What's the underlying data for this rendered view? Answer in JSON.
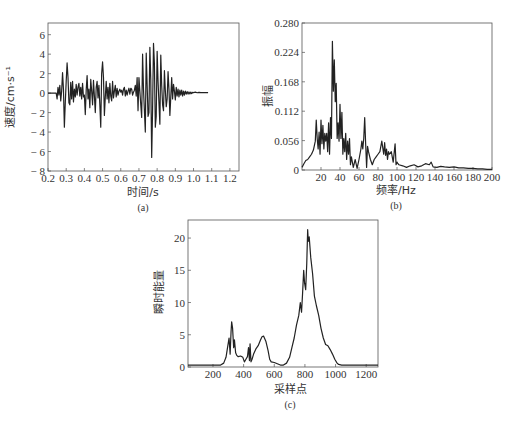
{
  "chart_data": [
    {
      "id": "a",
      "type": "line",
      "caption": "(a)",
      "xlabel": "时间/s",
      "ylabel": "速度/cm·s⁻¹",
      "xlim": [
        0.2,
        1.25
      ],
      "ylim": [
        -8,
        7.2
      ],
      "xticks": [
        0.2,
        0.3,
        0.4,
        0.5,
        0.6,
        0.7,
        0.8,
        0.9,
        1.0,
        1.1,
        1.2
      ],
      "xtick_labels": [
        "0.2",
        "0.3",
        "0.4",
        "0.5",
        "0.6",
        "0.7",
        "0.8",
        "0.9",
        "1.0",
        "1.1",
        "1.2"
      ],
      "yticks": [
        6,
        4,
        2,
        0,
        -2,
        -4,
        -6,
        -8
      ],
      "ytick_labels": [
        "6",
        "4",
        "2",
        "0",
        "− 2",
        "− 4",
        "− 6",
        "− 8"
      ],
      "grid": false,
      "series": [
        {
          "name": "velocity",
          "x": [
            0.2,
            0.245,
            0.25,
            0.255,
            0.26,
            0.265,
            0.27,
            0.275,
            0.28,
            0.285,
            0.29,
            0.295,
            0.3,
            0.305,
            0.31,
            0.315,
            0.32,
            0.325,
            0.33,
            0.335,
            0.34,
            0.345,
            0.35,
            0.355,
            0.36,
            0.365,
            0.37,
            0.375,
            0.38,
            0.385,
            0.39,
            0.395,
            0.4,
            0.405,
            0.41,
            0.415,
            0.42,
            0.425,
            0.43,
            0.435,
            0.44,
            0.445,
            0.45,
            0.455,
            0.46,
            0.465,
            0.47,
            0.475,
            0.48,
            0.485,
            0.49,
            0.495,
            0.5,
            0.505,
            0.51,
            0.515,
            0.52,
            0.525,
            0.53,
            0.535,
            0.54,
            0.545,
            0.55,
            0.555,
            0.56,
            0.565,
            0.57,
            0.575,
            0.58,
            0.585,
            0.59,
            0.595,
            0.6,
            0.605,
            0.61,
            0.615,
            0.62,
            0.625,
            0.63,
            0.635,
            0.64,
            0.645,
            0.65,
            0.655,
            0.66,
            0.665,
            0.67,
            0.675,
            0.68,
            0.685,
            0.69,
            0.695,
            0.7,
            0.705,
            0.71,
            0.715,
            0.72,
            0.725,
            0.73,
            0.735,
            0.74,
            0.745,
            0.75,
            0.755,
            0.76,
            0.765,
            0.77,
            0.775,
            0.78,
            0.785,
            0.79,
            0.795,
            0.8,
            0.805,
            0.81,
            0.815,
            0.82,
            0.825,
            0.83,
            0.835,
            0.84,
            0.845,
            0.85,
            0.855,
            0.86,
            0.865,
            0.87,
            0.875,
            0.88,
            0.885,
            0.89,
            0.895,
            0.9,
            0.905,
            0.91,
            0.915,
            0.92,
            0.925,
            0.93,
            0.935,
            0.94,
            0.945,
            0.95,
            0.955,
            0.96,
            0.965,
            0.97,
            0.975,
            0.98,
            0.985,
            0.99,
            0.995,
            1.0,
            1.01,
            1.02,
            1.03,
            1.04,
            1.05,
            1.06,
            1.07,
            1.08,
            1.09,
            1.1,
            1.12,
            1.14,
            1.16,
            1.18,
            1.2,
            1.25
          ],
          "values": [
            0,
            0,
            -0.6,
            0.6,
            -0.2,
            0.8,
            -0.8,
            0.2,
            2.1,
            0.4,
            -3.5,
            -1.0,
            1.2,
            3.1,
            1.6,
            -1.0,
            -1.2,
            1.1,
            -0.6,
            1.2,
            -0.9,
            0.4,
            -0.4,
            0.9,
            -0.2,
            0.6,
            1.0,
            -0.3,
            0.6,
            -0.6,
            1.0,
            -0.4,
            -0.2,
            -2.2,
            0.3,
            1.8,
            -0.6,
            0.4,
            -1.5,
            1.4,
            0.2,
            -1.2,
            1.3,
            -0.3,
            -2.0,
            0.6,
            1.2,
            -0.5,
            0.8,
            -1.2,
            -3.5,
            2.0,
            3.2,
            1.6,
            -2.3,
            -0.4,
            1.2,
            -0.6,
            0.6,
            -1.0,
            1.0,
            -0.3,
            -0.8,
            1.2,
            -0.5,
            0.2,
            0.8,
            -0.4,
            0.5,
            -0.2,
            0.2,
            0.4,
            0.1,
            0.3,
            -0.2,
            0.4,
            0.6,
            -0.3,
            0.3,
            -0.2,
            0.2,
            0.5,
            -0.1,
            0.5,
            0.4,
            -0.2,
            0.1,
            0.3,
            0.8,
            -0.3,
            1.6,
            -1.8,
            1.6,
            0.2,
            -1.2,
            -2.5,
            4.0,
            0.4,
            -1.8,
            -4.0,
            4.1,
            0.8,
            -2.4,
            -2.0,
            4.7,
            1.4,
            -6.6,
            -1.6,
            5.1,
            3.0,
            -3.5,
            -2.4,
            4.3,
            1.2,
            -1.0,
            -3.2,
            3.9,
            0.8,
            -1.2,
            -1.8,
            2.3,
            0.3,
            -1.4,
            -0.6,
            2.2,
            0.4,
            -2.3,
            -0.4,
            1.6,
            -0.6,
            0.9,
            0.2,
            -0.7,
            0.6,
            -0.3,
            0.4,
            -0.4,
            0.3,
            -0.2,
            0.3,
            -0.3,
            0.2,
            -0.2,
            0.2,
            -0.1,
            0.15,
            -0.1,
            0.12,
            -0.08,
            0.1,
            -0.05,
            0.08,
            0.05,
            0.1,
            0.04,
            0.08,
            0.05,
            0.05,
            0.05,
            0.05,
            0.05
          ]
        }
      ]
    },
    {
      "id": "b",
      "type": "line",
      "caption": "(b)",
      "xlabel": "频率/Hz",
      "ylabel": "振幅",
      "xlim": [
        0,
        200
      ],
      "ylim": [
        0,
        0.28
      ],
      "xticks": [
        20,
        40,
        60,
        80,
        100,
        120,
        140,
        160,
        180,
        200
      ],
      "xtick_labels": [
        "20",
        "40",
        "60",
        "80",
        "100",
        "120",
        "140",
        "160",
        "180",
        "200"
      ],
      "yticks": [
        0,
        0.056,
        0.112,
        0.168,
        0.224,
        0.28
      ],
      "ytick_labels": [
        "0",
        "0.056",
        "0.112",
        "0.168",
        "0.224",
        "0.280"
      ],
      "grid": false,
      "series": [
        {
          "name": "amplitude",
          "x": [
            0,
            2,
            4,
            6,
            8,
            10,
            12,
            14,
            15,
            16,
            17,
            18,
            19,
            20,
            21,
            22,
            23,
            24,
            25,
            26,
            27,
            28,
            29,
            30,
            31,
            32,
            33,
            34,
            35,
            36,
            37,
            38,
            39,
            40,
            41,
            42,
            43,
            44,
            45,
            46,
            47,
            48,
            49,
            50,
            51,
            52,
            54,
            56,
            58,
            60,
            62,
            63,
            64,
            65,
            66,
            67,
            68,
            69,
            70,
            72,
            74,
            76,
            78,
            80,
            82,
            84,
            86,
            87,
            88,
            89,
            90,
            91,
            92,
            94,
            96,
            98,
            99,
            100,
            101,
            102,
            106,
            110,
            114,
            118,
            122,
            126,
            130,
            134,
            136,
            138,
            142,
            146,
            150,
            155,
            160,
            165,
            170,
            175,
            180,
            185,
            190,
            195,
            200
          ],
          "values": [
            0.005,
            0.012,
            0.018,
            0.02,
            0.025,
            0.03,
            0.038,
            0.055,
            0.095,
            0.06,
            0.04,
            0.072,
            0.03,
            0.095,
            0.05,
            0.085,
            0.04,
            0.07,
            0.055,
            0.07,
            0.035,
            0.09,
            0.03,
            0.1,
            0.06,
            0.245,
            0.15,
            0.21,
            0.13,
            0.165,
            0.06,
            0.09,
            0.055,
            0.125,
            0.06,
            0.11,
            0.03,
            0.06,
            0.035,
            0.07,
            0.02,
            0.055,
            0.03,
            0.06,
            0.01,
            0.025,
            0.005,
            0.02,
            0.003,
            0.02,
            0.04,
            0.055,
            0.04,
            0.06,
            0.1,
            0.05,
            0.005,
            0.045,
            0.035,
            0.02,
            0.01,
            0.02,
            0.025,
            0.03,
            0.035,
            0.055,
            0.03,
            0.052,
            0.028,
            0.04,
            0.02,
            0.035,
            0.03,
            0.035,
            0.015,
            0.05,
            0.01,
            0.015,
            0.012,
            0.01,
            0.008,
            0.005,
            0.008,
            0.01,
            0.006,
            0.008,
            0.012,
            0.01,
            0.015,
            0.006,
            0.005,
            0.007,
            0.006,
            0.005,
            0.006,
            0.004,
            0.004,
            0.003,
            0.003,
            0.002,
            0.002,
            0.001,
            0.001
          ]
        }
      ]
    },
    {
      "id": "c",
      "type": "line",
      "caption": "(c)",
      "xlabel": "采样点",
      "ylabel": "瞬时能量",
      "xlim": [
        37,
        1277
      ],
      "ylim": [
        0,
        22.8
      ],
      "xticks": [
        200,
        400,
        600,
        800,
        1000,
        1200
      ],
      "xtick_labels": [
        "200",
        "400",
        "600",
        "800",
        "1000",
        "1200"
      ],
      "yticks": [
        0,
        5,
        10,
        15,
        20
      ],
      "ytick_labels": [
        "0",
        "5",
        "10",
        "15",
        "20"
      ],
      "grid": false,
      "series": [
        {
          "name": "instantaneous-energy",
          "x": [
            37,
            150,
            250,
            270,
            285,
            295,
            305,
            312,
            318,
            322,
            328,
            335,
            340,
            348,
            355,
            365,
            380,
            395,
            405,
            415,
            425,
            432,
            438,
            442,
            448,
            455,
            465,
            480,
            495,
            510,
            520,
            530,
            545,
            560,
            570,
            580,
            600,
            620,
            640,
            660,
            680,
            700,
            715,
            730,
            745,
            760,
            770,
            778,
            785,
            792,
            798,
            805,
            812,
            818,
            822,
            828,
            838,
            850,
            862,
            875,
            890,
            905,
            920,
            935,
            950,
            965,
            980,
            995,
            1010,
            1020,
            1040,
            1100,
            1200,
            1277
          ],
          "values": [
            0.3,
            0.3,
            0.3,
            0.6,
            1.5,
            3.0,
            4.5,
            2.0,
            5.5,
            7.0,
            6.0,
            3.0,
            4.2,
            2.2,
            1.8,
            1.6,
            1.7,
            1.5,
            0.8,
            1.2,
            1.6,
            3.0,
            1.0,
            3.6,
            0.8,
            1.2,
            2.0,
            2.8,
            3.3,
            4.2,
            4.7,
            4.8,
            4.0,
            2.5,
            1.2,
            0.8,
            0.7,
            0.5,
            0.3,
            0.3,
            0.6,
            1.5,
            3.0,
            4.5,
            6.5,
            8.0,
            10.0,
            8.5,
            11.5,
            15.0,
            13.0,
            12.0,
            16.0,
            21.3,
            19.5,
            20.2,
            17.0,
            14.5,
            11.0,
            9.5,
            8.0,
            6.0,
            4.5,
            3.5,
            3.3,
            2.7,
            2.0,
            1.2,
            0.6,
            0.4,
            0.3,
            0.3,
            0.3,
            0.3
          ]
        }
      ]
    }
  ]
}
